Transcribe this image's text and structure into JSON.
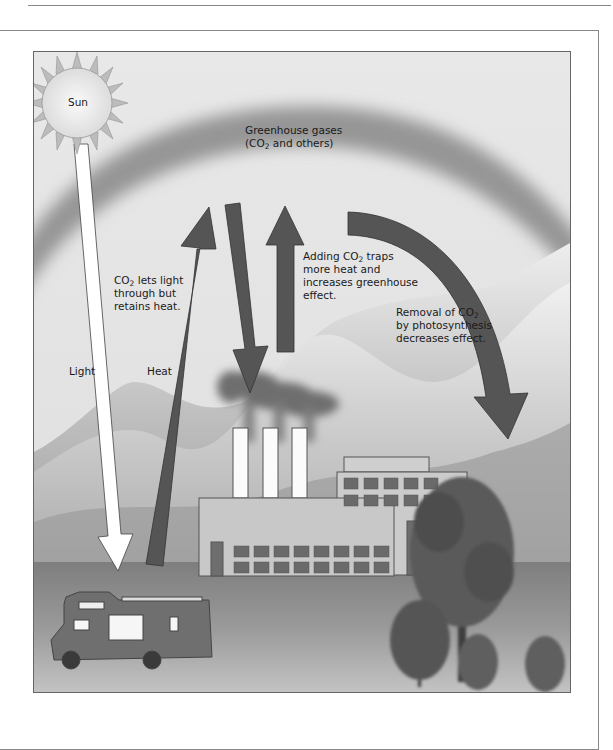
{
  "figure": {
    "labels": {
      "sun": "Sun",
      "greenhouse_gases_line1": "Greenhouse gases",
      "greenhouse_gases_line2_pre": "(CO",
      "greenhouse_gases_line2_sub": "2",
      "greenhouse_gases_line2_post": " and others)",
      "co2_lets_light_pre": "CO",
      "co2_lets_light_sub": "2",
      "co2_lets_light_post": "  lets light",
      "co2_lets_light_line2": "through but",
      "co2_lets_light_line3": "retains heat.",
      "light": "Light",
      "heat": "Heat",
      "adding_co2_pre": "Adding CO",
      "adding_co2_sub": "2",
      "adding_co2_post": " traps",
      "adding_co2_line2": "more heat and",
      "adding_co2_line3": "increases greenhouse",
      "adding_co2_line4": "effect.",
      "removal_pre": "Removal of CO",
      "removal_sub": "2",
      "removal_line2": "by photosynthesis",
      "removal_line3": "decreases effect."
    },
    "elements": [
      "sun",
      "greenhouse-gas-layer",
      "light-arrow",
      "heat-up-arrow",
      "heat-reflected-down-arrow",
      "heat-trapped-up-arrow",
      "photosynthesis-curved-arrow",
      "mountains",
      "factory-smoke",
      "factory-chimneys",
      "factory-building",
      "motorhome",
      "trees"
    ],
    "colors": {
      "sky": "#e6e6e6",
      "gas_layer": "#8c8c8c",
      "arrow_dark": "#555555",
      "arrow_light": "#ffffff",
      "building": "#c8c8c8",
      "window": "#6a6a6a",
      "ground": "#9a9a9a"
    }
  }
}
